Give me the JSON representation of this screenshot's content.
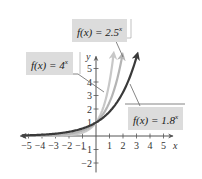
{
  "chart_data": {
    "type": "line",
    "title": "",
    "xlabel": "x",
    "ylabel": "y",
    "xlim": [
      -5.5,
      5.5
    ],
    "ylim": [
      -2.5,
      6
    ],
    "x_ticks": [
      -5,
      -4,
      -3,
      -2,
      -1,
      1,
      2,
      3,
      4,
      5
    ],
    "y_ticks": [
      -2,
      -1,
      1,
      2,
      3,
      4,
      5
    ],
    "x_tick_labels": [
      "-5",
      "-4",
      "-3",
      "-2",
      "-1",
      "1",
      "2",
      "3",
      "4",
      "5"
    ],
    "y_tick_labels": [
      "-2",
      "-1",
      "1",
      "2",
      "3",
      "4",
      "5"
    ],
    "grid": false,
    "series": [
      {
        "name": "f(x) = 4^x",
        "base": 4,
        "color": "#c8c8c8",
        "x_end": 1.3,
        "points": [
          [
            -5,
            0.001
          ],
          [
            -2,
            0.0625
          ],
          [
            -1,
            0.25
          ],
          [
            0,
            1
          ],
          [
            0.5,
            2
          ],
          [
            1,
            4
          ],
          [
            1.3,
            6.06
          ]
        ]
      },
      {
        "name": "f(x) = 2.5^x",
        "base": 2.5,
        "color": "#b4b4b4",
        "x_end": 1.95,
        "points": [
          [
            -5,
            0.01
          ],
          [
            -2,
            0.16
          ],
          [
            -1,
            0.4
          ],
          [
            0,
            1
          ],
          [
            1,
            2.5
          ],
          [
            1.5,
            3.95
          ],
          [
            1.95,
            5.97
          ]
        ]
      },
      {
        "name": "f(x) = 1.8^x",
        "base": 1.8,
        "color": "#3a3a3a",
        "x_end": 3.05,
        "points": [
          [
            -5,
            0.053
          ],
          [
            -4,
            0.095
          ],
          [
            -3,
            0.17
          ],
          [
            -2,
            0.31
          ],
          [
            -1,
            0.56
          ],
          [
            0,
            1
          ],
          [
            1,
            1.8
          ],
          [
            2,
            3.24
          ],
          [
            3,
            5.83
          ]
        ]
      }
    ],
    "annotations": [
      {
        "text": "f(x) = 2.5^x",
        "position": "top-center",
        "points_to": "f(x) = 2.5^x"
      },
      {
        "text": "f(x) = 4^x",
        "position": "upper-left",
        "points_to": "f(x) = 4^x"
      },
      {
        "text": "f(x) = 1.8^x",
        "position": "lower-right",
        "points_to": "f(x) = 1.8^x"
      }
    ]
  },
  "labels": {
    "l25": {
      "fx": "f(x) = 2.5",
      "exp": "x"
    },
    "l4": {
      "fx": "f(x) = 4",
      "exp": "x"
    },
    "l18": {
      "fx": "f(x) = 1.8",
      "exp": "x"
    }
  },
  "axes": {
    "x_label": "x",
    "y_label": "y"
  }
}
